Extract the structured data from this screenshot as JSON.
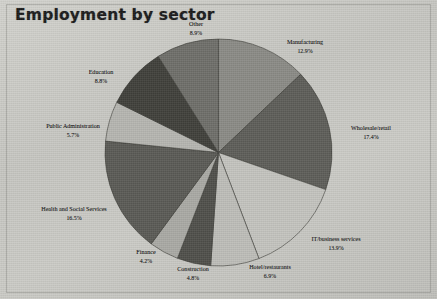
{
  "title": "Employment by sector",
  "chart_data": {
    "type": "pie",
    "title": "Employment by sector",
    "xlabel": "",
    "ylabel": "",
    "unit": "%",
    "start_angle_deg": 0,
    "direction": "clockwise",
    "legend": "none (labels placed around pie)",
    "grid": false,
    "categories": [
      "Manufacturing",
      "Wholesale/retail",
      "IT/business services",
      "Hotel/restaurants",
      "Construction",
      "Finance",
      "Health and Social Services",
      "Public Administration",
      "Education",
      "Other"
    ],
    "values": [
      12.9,
      17.4,
      13.9,
      6.9,
      4.8,
      4.2,
      16.5,
      5.7,
      8.8,
      8.9
    ],
    "slices": [
      {
        "label": "Manufacturing",
        "value": 12.9,
        "pct_text": "12.9%",
        "color": "#8a8a85"
      },
      {
        "label": "Wholesale/retail",
        "value": 17.4,
        "pct_text": "17.4%",
        "color": "#5d5d58"
      },
      {
        "label": "IT/business services",
        "value": 13.9,
        "pct_text": "13.9%",
        "color": "#c3c3be"
      },
      {
        "label": "Hotel/restaurants",
        "value": 6.9,
        "pct_text": "6.9%",
        "color": "#bdbdb8"
      },
      {
        "label": "Construction",
        "value": 4.8,
        "pct_text": "4.8%",
        "color": "#4f4f4a"
      },
      {
        "label": "Finance",
        "value": 4.2,
        "pct_text": "4.2%",
        "color": "#a9a9a4"
      },
      {
        "label": "Health and Social Services",
        "value": 16.5,
        "pct_text": "16.5%",
        "color": "#5a5a55"
      },
      {
        "label": "Public Administration",
        "value": 5.7,
        "pct_text": "5.7%",
        "color": "#b5b5b0"
      },
      {
        "label": "Education",
        "value": 8.8,
        "pct_text": "8.8%",
        "color": "#3f3f3a"
      },
      {
        "label": "Other",
        "value": 8.9,
        "pct_text": "8.9%",
        "color": "#6e6e69"
      }
    ]
  },
  "labels": {
    "manufacturing": {
      "name": "Manufacturing",
      "pct": "12.9%"
    },
    "wholesale": {
      "name": "Wholesale/retail",
      "pct": "17.4%"
    },
    "it_business": {
      "name": "IT/business services",
      "pct": "13.9%"
    },
    "hotel": {
      "name": "Hotel/restaurants",
      "pct": "6.9%"
    },
    "construction": {
      "name": "Construction",
      "pct": "4.8%"
    },
    "finance": {
      "name": "Finance",
      "pct": "4.2%"
    },
    "health": {
      "name": "Health and Social Services",
      "pct": "16.5%"
    },
    "public_admin": {
      "name": "Public Administration",
      "pct": "5.7%"
    },
    "education": {
      "name": "Education",
      "pct": "8.8%"
    },
    "other": {
      "name": "Other",
      "pct": "8.9%"
    }
  }
}
